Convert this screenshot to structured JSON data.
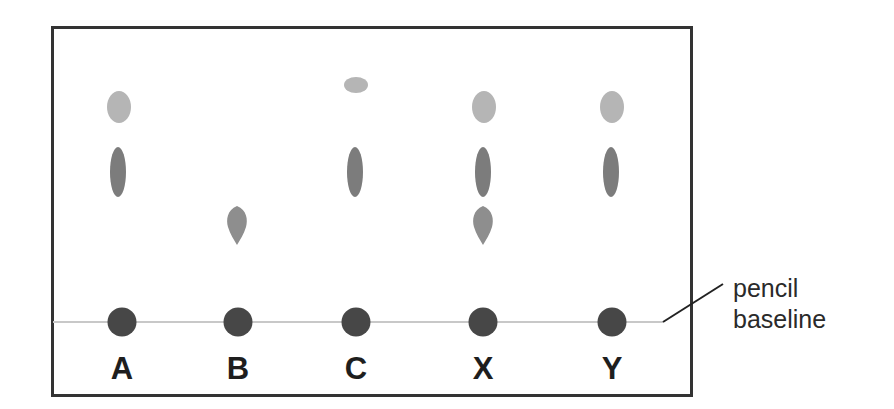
{
  "diagram": {
    "frame": {
      "x": 51,
      "y": 26,
      "width": 642,
      "height": 371,
      "stroke": "#333333",
      "stroke_width": 3
    },
    "baseline": {
      "y": 322,
      "x_start": 52,
      "x_end": 663,
      "color": "#c8c8c8"
    },
    "annotation": {
      "line1": "pencil",
      "line2": "baseline",
      "leader": {
        "x1": 663,
        "y1": 322,
        "x2": 723,
        "y2": 284
      }
    },
    "colors": {
      "origin_dot": "#474747",
      "light_spot": "#b5b5b5",
      "dark_spot": "#7c7c7c",
      "teardrop_spot": "#8e8e8e",
      "label": "#1e1e1e"
    },
    "lanes": [
      {
        "label": "A",
        "x": 122,
        "spots": [
          "light",
          "dark"
        ]
      },
      {
        "label": "B",
        "x": 238,
        "spots": [
          "teardrop"
        ]
      },
      {
        "label": "C",
        "x": 356,
        "spots": [
          "small-top",
          "dark"
        ]
      },
      {
        "label": "X",
        "x": 483,
        "spots": [
          "light",
          "dark",
          "teardrop"
        ]
      },
      {
        "label": "Y",
        "x": 612,
        "spots": [
          "light",
          "dark"
        ]
      }
    ]
  }
}
